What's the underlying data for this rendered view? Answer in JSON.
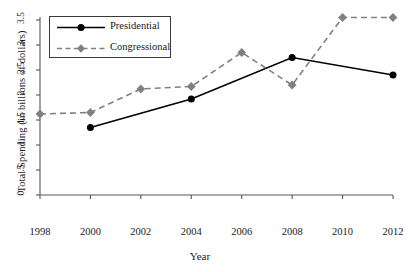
{
  "chart_data": {
    "type": "line",
    "title": "",
    "xlabel": "Year",
    "ylabel": "Total Spending (in billions of dollars)",
    "x": [
      1998,
      2000,
      2002,
      2004,
      2006,
      2008,
      2010,
      2012
    ],
    "xtick_labels": [
      "1998",
      "2000",
      "2002",
      "2004",
      "2006",
      "2008",
      "2010",
      "2012"
    ],
    "ytick_labels": [
      "0",
      ".5",
      "1",
      "1.5",
      "2",
      "2.5",
      "3",
      "3.5"
    ],
    "ytick_values": [
      0,
      0.5,
      1,
      1.5,
      2,
      2.5,
      3,
      3.5
    ],
    "xlim": [
      1998,
      2012
    ],
    "ylim": [
      0,
      3.5
    ],
    "grid": false,
    "legend_position": "top-left",
    "series": [
      {
        "name": "Presidential",
        "color": "#000000",
        "linestyle": "solid",
        "marker": "circle",
        "x": [
          2000,
          2004,
          2008,
          2012
        ],
        "values": [
          1.35,
          1.92,
          2.75,
          2.4
        ]
      },
      {
        "name": "Congressional",
        "color": "#808080",
        "linestyle": "dashed",
        "marker": "diamond",
        "x": [
          1998,
          2000,
          2002,
          2004,
          2006,
          2008,
          2010,
          2012
        ],
        "values": [
          1.62,
          1.65,
          2.12,
          2.17,
          2.85,
          2.2,
          3.55,
          3.55
        ]
      }
    ]
  },
  "legend": {
    "entries": [
      {
        "label": "Presidential"
      },
      {
        "label": "Congressional"
      }
    ]
  }
}
